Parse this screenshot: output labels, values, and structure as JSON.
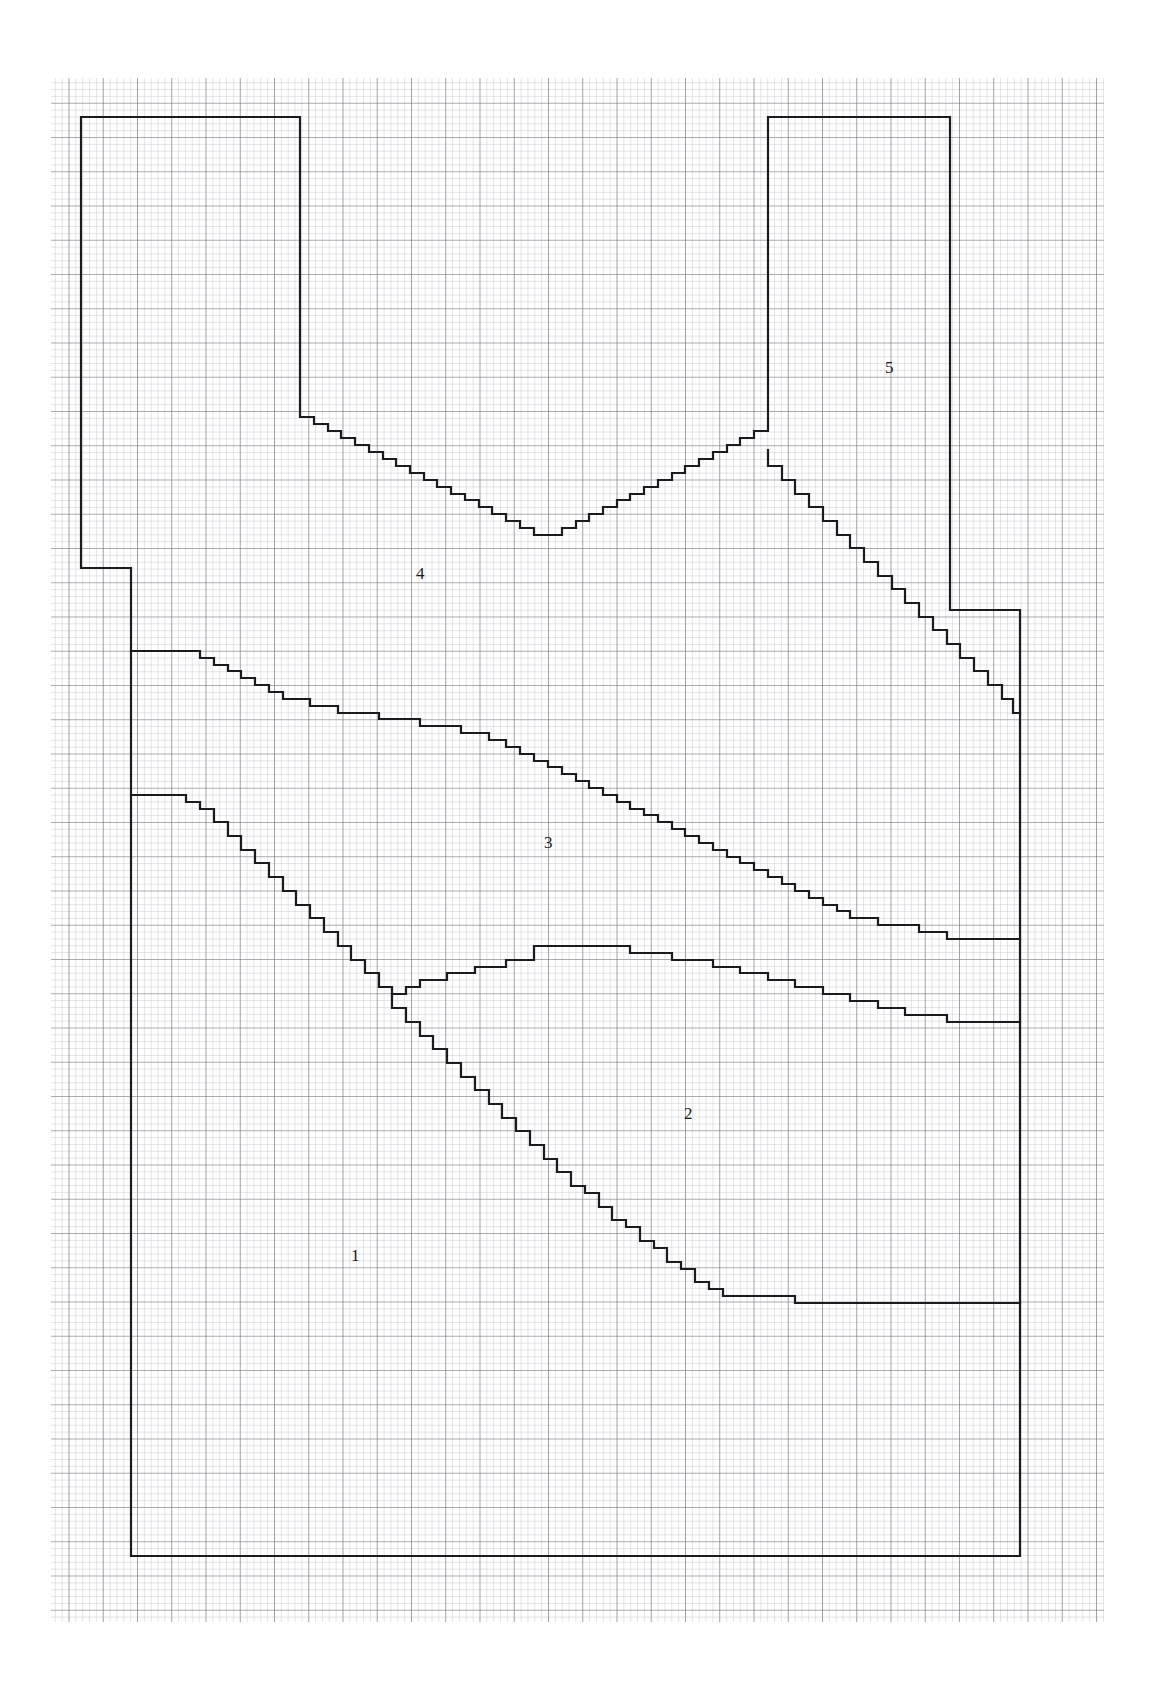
{
  "document": {
    "kind": "graph-paper-contour-map",
    "background_color": "#ffffff",
    "page_width": 1163,
    "page_height": 1686
  },
  "grid": {
    "minor_spacing_px": 6.85,
    "major_every": 5,
    "minor_color": "#b9bcc4",
    "major_color": "#6f737c",
    "origin_x": 51,
    "origin_y": 78,
    "extent_x": 1104,
    "extent_y": 1622
  },
  "outline": {
    "stroke_color": "#1b1b1b",
    "stroke_width_px": 2.2,
    "boundary_points": [
      [
        81,
        117
      ],
      [
        300,
        117
      ],
      [
        300,
        417
      ],
      [
        81,
        417
      ],
      [
        81,
        568
      ],
      [
        131,
        568
      ],
      [
        131,
        1556
      ],
      [
        1020,
        1556
      ],
      [
        1020,
        610
      ],
      [
        950,
        610
      ],
      [
        950,
        117
      ],
      [
        768,
        117
      ],
      [
        768,
        450
      ]
    ]
  },
  "regions": [
    {
      "id": "region-1",
      "label": "1",
      "label_x": 356,
      "label_y": 1256
    },
    {
      "id": "region-2",
      "label": "2",
      "label_x": 689,
      "label_y": 1114
    },
    {
      "id": "region-3",
      "label": "3",
      "label_x": 549,
      "label_y": 843
    },
    {
      "id": "region-4",
      "label": "4",
      "label_x": 421,
      "label_y": 574
    },
    {
      "id": "region-5",
      "label": "5",
      "label_x": 890,
      "label_y": 368
    }
  ],
  "contours": [
    {
      "id": "contour-4-5-upper",
      "description": "stepped V-notch separating region 4 from region 5 across the upper field"
    },
    {
      "id": "contour-3-4",
      "description": "stepped descending boundary separating region 3 from region 4"
    },
    {
      "id": "contour-2-3",
      "description": "stepped boundary with central plateau separating region 2 from region 3"
    },
    {
      "id": "contour-1-2",
      "description": "stepped descending boundary separating region 1 from region 2"
    }
  ],
  "colors": {
    "ink": "#1b1b1b",
    "grid_minor": "#b9bcc4",
    "grid_major": "#6f737c",
    "paper": "#ffffff"
  }
}
